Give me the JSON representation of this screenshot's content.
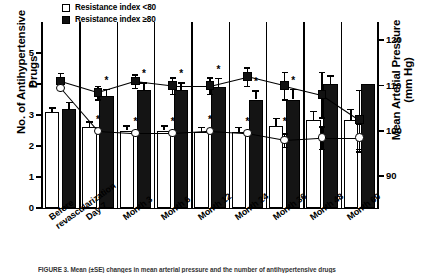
{
  "legend": {
    "items": [
      {
        "label": "Resistance index <80",
        "style": "open",
        "name": "legend-open-square"
      },
      {
        "label": "Resistance index ≥80",
        "style": "filled",
        "name": "legend-filled-square"
      }
    ]
  },
  "axes": {
    "left_title": "No. of Antihypertensive Drugs",
    "right_title": "Mean Arterial Pressure (mm Hg)",
    "left_ticks": [
      "0",
      "1",
      "2",
      "3",
      "4",
      "5"
    ],
    "right_ticks": [
      "90",
      "100",
      "110",
      "120"
    ]
  },
  "caption": "FIGURE 3.   Mean (±SE) changes in mean arterial pressure and the number of antihypertensive drugs",
  "chart_data": {
    "type": "bar",
    "title": "",
    "xlabel": "",
    "ylabel": "No. of Antihypertensive Drugs",
    "y2label": "Mean Arterial Pressure (mm Hg)",
    "ylim": [
      0,
      6
    ],
    "y2lim": [
      83.0,
      124.0
    ],
    "grid": false,
    "legend_position": "top-left",
    "categories": [
      "Before\nrevascularization",
      "Day 7",
      "Month 3",
      "Month 6",
      "Month 12",
      "Month 24",
      "Month 36",
      "Month 48",
      "Month 60"
    ],
    "series": [
      {
        "name": "Resistance index <80",
        "type": "bar",
        "style": "open",
        "axis": "left",
        "values": [
          3.1,
          2.6,
          2.5,
          2.5,
          2.45,
          2.45,
          2.65,
          2.85,
          2.85
        ],
        "errors": [
          0.15,
          0.2,
          0.17,
          0.17,
          0.17,
          0.17,
          0.25,
          0.28,
          0.35
        ],
        "significance": [
          false,
          false,
          false,
          false,
          false,
          false,
          false,
          false,
          false
        ]
      },
      {
        "name": "Resistance index ≥80",
        "type": "bar",
        "style": "filled",
        "axis": "left",
        "values": [
          3.2,
          3.6,
          3.8,
          3.8,
          3.9,
          3.5,
          3.5,
          4.0,
          4.0
        ],
        "errors": [
          0.22,
          0.25,
          0.25,
          0.25,
          0.3,
          0.3,
          0.35,
          0.28,
          0.0
        ],
        "significance": [
          false,
          true,
          true,
          true,
          true,
          true,
          true,
          false,
          false
        ]
      },
      {
        "name": "Resistance index <80 (MAP)",
        "type": "line",
        "marker": "open-circle",
        "axis": "right",
        "values": [
          109.5,
          100.0,
          99.5,
          99.5,
          100.0,
          99.5,
          98.0,
          98.5,
          98.5
        ],
        "errors": [
          0.0,
          0.0,
          0.0,
          0.0,
          0.0,
          0.0,
          1.5,
          2.5,
          3.0
        ],
        "significance": [
          false,
          true,
          true,
          true,
          true,
          true,
          true,
          false,
          false
        ]
      },
      {
        "name": "Resistance index ≥80 (MAP)",
        "type": "line",
        "marker": "filled-square",
        "axis": "right",
        "values": [
          111.0,
          108.5,
          111.0,
          110.0,
          110.0,
          112.0,
          110.0,
          108.0,
          102.5
        ],
        "errors": [
          1.8,
          1.5,
          1.5,
          1.8,
          1.8,
          2.0,
          3.0,
          5.0,
          6.5
        ],
        "significance": [
          false,
          false,
          false,
          false,
          false,
          false,
          false,
          false,
          false
        ]
      }
    ],
    "annotation_symbol": "*"
  }
}
